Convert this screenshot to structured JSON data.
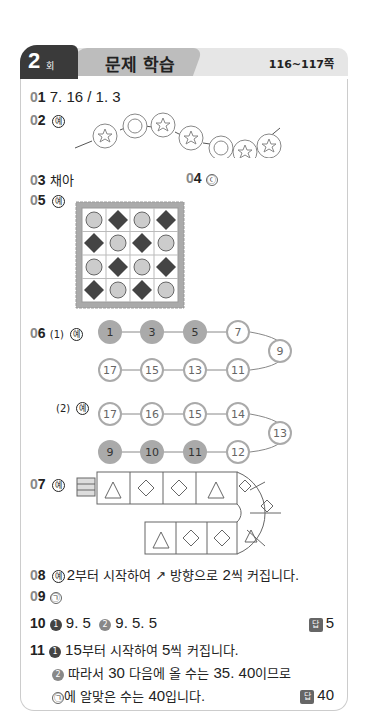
{
  "header": {
    "session_number": "2",
    "session_suffix": "회",
    "title": "문제 학습",
    "pages": "116~117쪽"
  },
  "ye_label": "예",
  "answers": {
    "q01": {
      "number": "01",
      "text": "7. 16 / 1. 3"
    },
    "q02": {
      "number": "02",
      "pattern": [
        "star",
        "circle",
        "star",
        "star",
        "circle",
        "star",
        "star"
      ]
    },
    "q03": {
      "number": "03",
      "text": "채아"
    },
    "q04": {
      "number": "04",
      "text": "ⓒ"
    },
    "q05": {
      "number": "05",
      "grid": [
        [
          "circle",
          "diamond",
          "circle",
          "diamond"
        ],
        [
          "diamond",
          "circle",
          "diamond",
          "circle"
        ],
        [
          "circle",
          "diamond",
          "circle",
          "diamond"
        ],
        [
          "diamond",
          "circle",
          "diamond",
          "circle"
        ]
      ]
    },
    "q06": {
      "number": "06",
      "part1_label": "(1)",
      "part1_top": [
        "1",
        "3",
        "5",
        "7"
      ],
      "part1_turn": "9",
      "part1_bottom": [
        "17",
        "15",
        "13",
        "11"
      ],
      "part1_highlighted": [
        "1",
        "3",
        "5"
      ],
      "part2_label": "(2)",
      "part2_top": [
        "17",
        "16",
        "15",
        "14"
      ],
      "part2_turn": "13",
      "part2_bottom": [
        "9",
        "10",
        "11",
        "12"
      ],
      "part2_highlighted": [
        "9",
        "10",
        "11"
      ]
    },
    "q07": {
      "number": "07",
      "top_row": [
        "triangle",
        "diamond",
        "diamond",
        "triangle"
      ],
      "curve": [
        "diamond",
        "diamond",
        "triangle"
      ],
      "bottom_row": [
        "triangle",
        "diamond",
        "diamond"
      ]
    },
    "q08": {
      "number": "08",
      "text_a": "2",
      "text_b": "부터 시작하여",
      "arrow": "↗",
      "text_c": "방향으로",
      "text_d": "2",
      "text_e": "씩 커집니다."
    },
    "q09": {
      "number": "09",
      "text": "㉠"
    },
    "q10": {
      "number": "10",
      "step1_marker": "1",
      "step1": "9. 5",
      "step2_marker": "2",
      "step2": "9. 5. 5",
      "answer_label": "답",
      "answer": "5"
    },
    "q11": {
      "number": "11",
      "step1_marker": "1",
      "step1_a": "15",
      "step1_b": "부터 시작하여",
      "step1_c": "5",
      "step1_d": "씩 커집니다.",
      "step2_marker": "2",
      "step2_a": "따라서",
      "step2_b": "30",
      "step2_c": "다음에 올 수는",
      "step2_d": "35. 40",
      "step2_e": "이므로",
      "step3_a": "㉠",
      "step3_b": "에 알맞은 수는",
      "step3_c": "40",
      "step3_d": "입니다.",
      "answer_label": "답",
      "answer": "40"
    }
  }
}
